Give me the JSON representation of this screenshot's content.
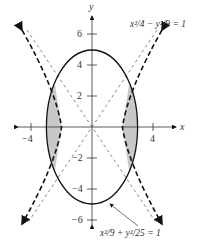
{
  "figure": {
    "axes": {
      "x_label": "x",
      "y_label": "y",
      "x_ticks": [
        {
          "value": -4,
          "label": "−4"
        },
        {
          "value": 4,
          "label": "4"
        }
      ],
      "y_ticks": [
        {
          "value": 6,
          "label": "6"
        },
        {
          "value": 4,
          "label": "4"
        },
        {
          "value": 2,
          "label": "2"
        },
        {
          "value": -2,
          "label": "−2"
        },
        {
          "value": -4,
          "label": "−4"
        },
        {
          "value": -6,
          "label": "−6"
        }
      ]
    },
    "curves": {
      "hyperbola_label": "x²/4 − y²/9 = 1",
      "ellipse_label": "x²/9 + y²/25 = 1"
    },
    "colors": {
      "curve": "#111111",
      "shade": "#c8c8c8",
      "asymptote": "#555555"
    }
  }
}
